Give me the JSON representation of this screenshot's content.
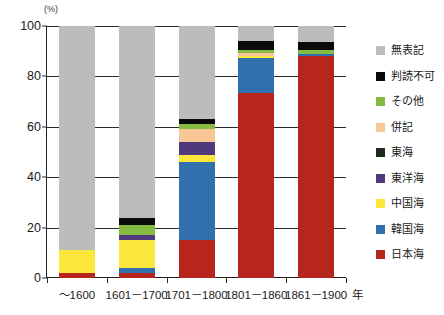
{
  "chart_data": {
    "type": "bar",
    "subtype": "stacked-percentage-bar",
    "title": "",
    "xlabel": "年",
    "ylabel": "(%)",
    "ylim": [
      0,
      100
    ],
    "yticks": [
      0,
      20,
      40,
      60,
      80,
      100
    ],
    "grid": true,
    "legend_position": "right",
    "categories": [
      "～1600",
      "1601－1700",
      "1701－1800",
      "1801－1860",
      "1861－1900"
    ],
    "series": [
      {
        "name": "日本海",
        "color": "#b7261d",
        "values": [
          2.0,
          2.0,
          15.0,
          73.5,
          88.0
        ]
      },
      {
        "name": "韓国海",
        "color": "#2f70ad",
        "values": [
          0.0,
          2.0,
          31.0,
          14.0,
          1.0
        ]
      },
      {
        "name": "中国海",
        "color": "#fbe63b",
        "values": [
          9.0,
          11.0,
          3.0,
          0.5,
          0.0
        ]
      },
      {
        "name": "東洋海",
        "color": "#51397e",
        "values": [
          0.0,
          2.0,
          5.0,
          0.0,
          0.0
        ]
      },
      {
        "name": "東海",
        "color": "#1d2a1c",
        "values": [
          0.0,
          0.0,
          0.0,
          0.0,
          0.0
        ]
      },
      {
        "name": "併記",
        "color": "#f7c796",
        "values": [
          0.0,
          0.0,
          5.0,
          1.5,
          0.0
        ]
      },
      {
        "name": "その他",
        "color": "#84bb40",
        "values": [
          0.0,
          4.0,
          2.0,
          1.0,
          1.5
        ]
      },
      {
        "name": "判読不可",
        "color": "#0a0a0a",
        "values": [
          0.0,
          3.0,
          2.0,
          3.5,
          3.0
        ]
      },
      {
        "name": "無表記",
        "color": "#bcbcbc",
        "values": [
          89.0,
          76.0,
          37.0,
          6.0,
          6.5
        ]
      }
    ],
    "legend_entries": [
      {
        "label": "無表記",
        "color": "#bcbcbc"
      },
      {
        "label": "判読不可",
        "color": "#0a0a0a"
      },
      {
        "label": "その他",
        "color": "#84bb40"
      },
      {
        "label": "併記",
        "color": "#f7c796"
      },
      {
        "label": "東海",
        "color": "#1d2a1c"
      },
      {
        "label": "東洋海",
        "color": "#51397e"
      },
      {
        "label": "中国海",
        "color": "#fbe63b"
      },
      {
        "label": "韓国海",
        "color": "#2f70ad"
      },
      {
        "label": "日本海",
        "color": "#b7261d"
      }
    ]
  }
}
